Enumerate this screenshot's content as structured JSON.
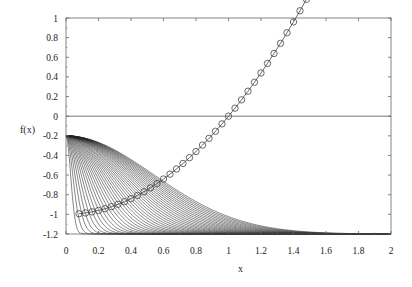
{
  "chart_data": {
    "type": "line",
    "title": "",
    "xlabel": "x",
    "ylabel": "f(x)",
    "xlim": [
      0,
      2
    ],
    "ylim": [
      -1.2,
      1
    ],
    "xticks": [
      "0",
      "0.2",
      "0.4",
      "0.6",
      "0.8",
      "1",
      "1.2",
      "1.4",
      "1.6",
      "1.8",
      "2"
    ],
    "yticks": [
      "1",
      "0.8",
      "0.6",
      "0.4",
      "0.2",
      "0",
      "-0.2",
      "-0.4",
      "-0.6",
      "-0.8",
      "-1",
      "-1.2"
    ],
    "grid": false,
    "legend": "none",
    "reference_lines": [
      {
        "orientation": "horizontal",
        "y": 0
      }
    ],
    "series": [
      {
        "name": "marker curve (circles)",
        "style": "line with open circle markers",
        "formula": "y = x^2 - 1",
        "x_start": 0.08,
        "x_end": 1.6,
        "x_step": 0.04
      },
      {
        "name": "curve family",
        "style": "thin black lines",
        "count": 40,
        "description": "Each curve starts at f(0) = -0.2 and decays to the floor of -1.2; successive curves decay more slowly, the slowest reaching -1.2 near x = 1.8",
        "start_value": -0.2,
        "floor_value": -1.2
      }
    ]
  }
}
